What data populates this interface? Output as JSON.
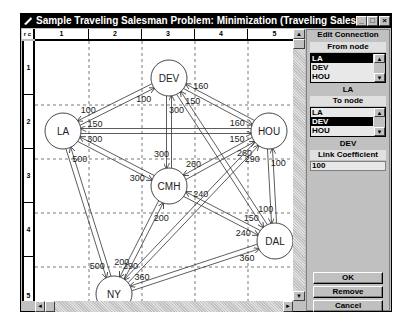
{
  "window": {
    "title": "Sample Traveling Salesman Problem: Minimization (Traveling Sales...",
    "minimize_label": "_",
    "maximize_label": "□",
    "close_label": "×"
  },
  "grid": {
    "corner_label": "r c",
    "columns": [
      "1",
      "2",
      "3",
      "4",
      "5"
    ],
    "rows": [
      "1",
      "2",
      "3",
      "4",
      "5"
    ]
  },
  "nodes": [
    {
      "id": "DEV",
      "label": "DEV",
      "x": 168,
      "y": 77
    },
    {
      "id": "LA",
      "label": "LA",
      "x": 62,
      "y": 130
    },
    {
      "id": "HOU",
      "label": "HOU",
      "x": 268,
      "y": 130
    },
    {
      "id": "CMH",
      "label": "CMH",
      "x": 168,
      "y": 185
    },
    {
      "id": "DAL",
      "label": "DAL",
      "x": 274,
      "y": 240
    },
    {
      "id": "NY",
      "label": "NY",
      "x": 113,
      "y": 293
    }
  ],
  "edges": [
    {
      "from": "LA",
      "to": "DEV",
      "labels": [
        "100",
        "100"
      ]
    },
    {
      "from": "LA",
      "to": "HOU",
      "labels": [
        "150",
        "150"
      ]
    },
    {
      "from": "LA",
      "to": "CMH",
      "labels": [
        "300",
        "300"
      ]
    },
    {
      "from": "LA",
      "to": "NY",
      "labels": [
        "500",
        "500"
      ]
    },
    {
      "from": "DEV",
      "to": "CMH",
      "labels": [
        "300",
        "300"
      ]
    },
    {
      "from": "DEV",
      "to": "HOU",
      "labels": [
        "160",
        "160"
      ]
    },
    {
      "from": "DEV",
      "to": "DAL",
      "labels": [
        "150",
        "150"
      ]
    },
    {
      "from": "HOU",
      "to": "CMH",
      "labels": [
        "260",
        "260"
      ]
    },
    {
      "from": "HOU",
      "to": "NY",
      "labels": [
        "290",
        "290"
      ]
    },
    {
      "from": "HOU",
      "to": "DAL",
      "labels": [
        "100",
        "100"
      ]
    },
    {
      "from": "CMH",
      "to": "DAL",
      "labels": [
        "240",
        "240"
      ]
    },
    {
      "from": "CMH",
      "to": "NY",
      "labels": [
        "200",
        "200"
      ]
    },
    {
      "from": "DAL",
      "to": "NY",
      "labels": [
        "360",
        "360"
      ]
    }
  ],
  "panel": {
    "title": "Edit Connection",
    "from_label": "From node",
    "from_options": [
      "LA",
      "DEV",
      "HOU"
    ],
    "from_selected": "LA",
    "from_value": "LA",
    "to_label": "To node",
    "to_options": [
      "LA",
      "DEV",
      "HOU"
    ],
    "to_selected": "DEV",
    "to_value": "DEV",
    "coef_label": "Link Coefficient",
    "coef_value": "100",
    "ok_label": "OK",
    "remove_label": "Remove",
    "cancel_label": "Cancel"
  },
  "scroll": {
    "up": "▲",
    "down": "▼",
    "left": "◄",
    "right": "►"
  }
}
